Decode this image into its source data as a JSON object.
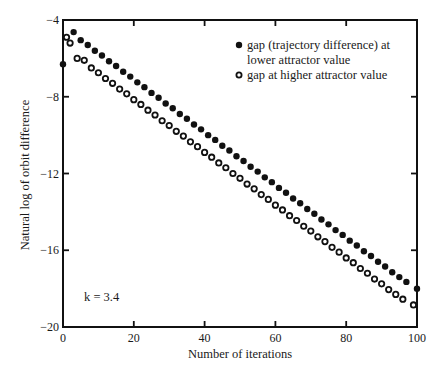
{
  "chart_data": {
    "type": "scatter",
    "title": "",
    "xlabel": "Number of iterations",
    "ylabel": "Natural log of orbit difference",
    "xlim": [
      0,
      100
    ],
    "ylim": [
      -20,
      -4
    ],
    "xticks": [
      0,
      20,
      40,
      60,
      80,
      100
    ],
    "yticks": [
      -4,
      -8,
      -12,
      -16,
      -20
    ],
    "xtick_labels": [
      "0",
      "20",
      "40",
      "60",
      "80",
      "100"
    ],
    "ytick_labels": [
      "−4",
      "−8",
      "−12",
      "−16",
      "−20"
    ],
    "grid": false,
    "legend_position": "upper right (inside plot)",
    "annotation": "k = 3.4",
    "series": [
      {
        "name": "gap (trajectory difference) at lower attractor value",
        "legend_lines": [
          "gap (trajectory difference) at",
          "lower attractor value"
        ],
        "marker": "filled-circle",
        "color": "#111111",
        "x": [
          0,
          3,
          5,
          7,
          9,
          11,
          13,
          15,
          17,
          19,
          21,
          23,
          25,
          27,
          29,
          31,
          33,
          35,
          37,
          39,
          41,
          43,
          45,
          47,
          49,
          51,
          53,
          55,
          57,
          59,
          61,
          63,
          65,
          67,
          69,
          71,
          73,
          75,
          77,
          79,
          81,
          83,
          85,
          87,
          89,
          91,
          93,
          95,
          97,
          100
        ],
        "y": [
          -6.3,
          -4.63,
          -5.05,
          -5.3,
          -5.6,
          -5.85,
          -6.15,
          -6.4,
          -6.7,
          -6.95,
          -7.25,
          -7.5,
          -7.8,
          -8.05,
          -8.35,
          -8.6,
          -8.9,
          -9.15,
          -9.45,
          -9.7,
          -10.0,
          -10.25,
          -10.55,
          -10.8,
          -11.1,
          -11.35,
          -11.65,
          -11.9,
          -12.2,
          -12.45,
          -12.75,
          -13.0,
          -13.3,
          -13.55,
          -13.85,
          -14.1,
          -14.4,
          -14.65,
          -14.95,
          -15.2,
          -15.5,
          -15.75,
          -16.05,
          -16.3,
          -16.6,
          -16.85,
          -17.15,
          -17.4,
          -17.65,
          -18.0
        ]
      },
      {
        "name": "gap at higher attractor value",
        "legend_lines": [
          "gap at higher attractor value"
        ],
        "marker": "open-circle",
        "color": "#111111",
        "x": [
          1,
          2,
          4,
          6,
          8,
          10,
          12,
          14,
          16,
          18,
          20,
          22,
          24,
          26,
          28,
          30,
          32,
          34,
          36,
          38,
          40,
          42,
          44,
          46,
          48,
          50,
          52,
          54,
          56,
          58,
          60,
          62,
          64,
          66,
          68,
          70,
          72,
          74,
          76,
          78,
          80,
          82,
          84,
          86,
          88,
          90,
          92,
          94,
          96,
          99
        ],
        "y": [
          -4.9,
          -5.2,
          -6.0,
          -6.1,
          -6.5,
          -6.75,
          -7.05,
          -7.3,
          -7.6,
          -7.85,
          -8.15,
          -8.4,
          -8.7,
          -8.95,
          -9.25,
          -9.5,
          -9.8,
          -10.05,
          -10.35,
          -10.6,
          -10.9,
          -11.15,
          -11.45,
          -11.7,
          -12.0,
          -12.25,
          -12.55,
          -12.8,
          -13.1,
          -13.35,
          -13.65,
          -13.9,
          -14.2,
          -14.45,
          -14.75,
          -15.0,
          -15.3,
          -15.55,
          -15.85,
          -16.1,
          -16.4,
          -16.65,
          -16.95,
          -17.2,
          -17.5,
          -17.75,
          -18.05,
          -18.3,
          -18.55,
          -18.85
        ]
      }
    ]
  }
}
